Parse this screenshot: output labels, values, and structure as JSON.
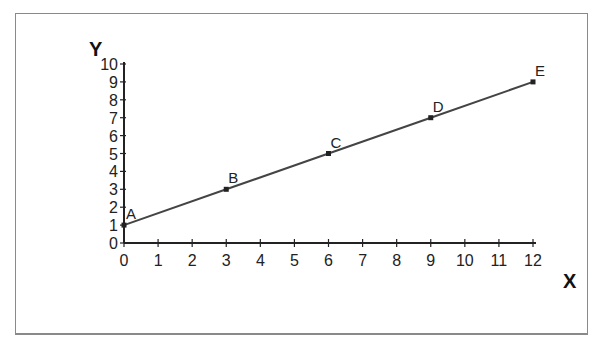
{
  "chart_data": {
    "type": "line",
    "title": "",
    "xlabel": "X",
    "ylabel": "Y",
    "xlim": [
      0,
      12
    ],
    "ylim": [
      0,
      10
    ],
    "x_ticks": [
      "0",
      "1",
      "2",
      "3",
      "4",
      "5",
      "6",
      "7",
      "8",
      "9",
      "10",
      "11",
      "12"
    ],
    "y_ticks": [
      "0",
      "1",
      "2",
      "3",
      "4",
      "5",
      "6",
      "7",
      "8",
      "9",
      "10"
    ],
    "grid": false,
    "legend": null,
    "series": [
      {
        "name": "line",
        "points": [
          {
            "label": "A",
            "x": 0,
            "y": 1
          },
          {
            "label": "B",
            "x": 3,
            "y": 3
          },
          {
            "label": "C",
            "x": 6,
            "y": 5
          },
          {
            "label": "D",
            "x": 9,
            "y": 7
          },
          {
            "label": "E",
            "x": 12,
            "y": 9
          }
        ]
      }
    ],
    "colors": {
      "line": "#444444",
      "axis": "#222222",
      "frame": "#8a8a8a"
    }
  }
}
